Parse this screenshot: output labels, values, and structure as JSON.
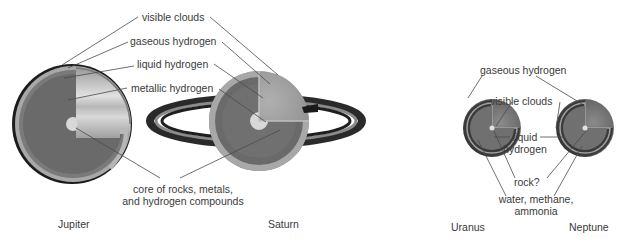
{
  "planets": [
    {
      "name": "Jupiter"
    },
    {
      "name": "Saturn"
    },
    {
      "name": "Uranus"
    },
    {
      "name": "Neptune"
    }
  ],
  "labels_jupiter_saturn": {
    "visible_clouds": "visible clouds",
    "gaseous_hydrogen": "gaseous hydrogen",
    "liquid_hydrogen": "liquid hydrogen",
    "metallic_hydrogen": "metallic hydrogen",
    "core_line1": "core of rocks, metals,",
    "core_line2": "and hydrogen compounds"
  },
  "labels_uranus_neptune": {
    "gaseous_hydrogen": "gaseous hydrogen",
    "visible_clouds": "visible clouds",
    "liquid_line1": "liquid",
    "liquid_line2": "hydrogen",
    "rock": "rock?",
    "mantle_line1": "water, methane,",
    "mantle_line2": "ammonia"
  },
  "colors": {
    "background": "#ffffff",
    "leader_line": "#4a4a4a",
    "outer_rim": "#2a2a2a",
    "gas_layer": "#a8a8a8",
    "liquid_layer": "#7a7a7a",
    "metallic_layer": "#6a6a6a",
    "core": "#d8d8d8",
    "ring_dark": "#1e1e1e",
    "ring_mid": "#8a8a8a"
  }
}
